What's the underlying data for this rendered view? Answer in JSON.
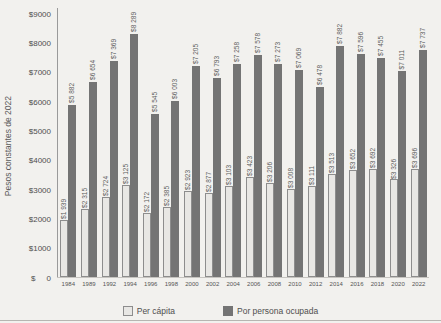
{
  "figure": {
    "legend": [
      {
        "name": "Per cápita",
        "swatch": "light"
      },
      {
        "name": "Por persona ocupada",
        "swatch": "dark"
      }
    ],
    "colors": {
      "background": "#f2f1ee",
      "light_bar": "#e8e7e4",
      "light_bar_border": "#8d8d8d",
      "dark_bar": "#747474",
      "text": "#4f4f4f",
      "axis": "#9a9a9a"
    }
  },
  "chart_data": {
    "type": "bar",
    "title": "",
    "xlabel": "",
    "ylabel": "Pesos constantes de 2022",
    "ylim": [
      0,
      9000
    ],
    "grid": false,
    "legend_position": "bottom",
    "y_ticks": [
      {
        "value": 0,
        "label": "$     0"
      },
      {
        "value": 1000,
        "label": "$1000"
      },
      {
        "value": 2000,
        "label": "$2000"
      },
      {
        "value": 3000,
        "label": "$3000"
      },
      {
        "value": 4000,
        "label": "$4000"
      },
      {
        "value": 5000,
        "label": "$5000"
      },
      {
        "value": 6000,
        "label": "$6000"
      },
      {
        "value": 7000,
        "label": "$7000"
      },
      {
        "value": 8000,
        "label": "$8000"
      },
      {
        "value": 9000,
        "label": "$9000"
      }
    ],
    "categories": [
      "1984",
      "1989",
      "1992",
      "1994",
      "1996",
      "1998",
      "2000",
      "2002",
      "2004",
      "2006",
      "2008",
      "2010",
      "2012",
      "2014",
      "2016",
      "2018",
      "2020",
      "2022"
    ],
    "series": [
      {
        "name": "Per cápita",
        "values": [
          1939,
          2315,
          2724,
          3125,
          2172,
          2385,
          2923,
          2877,
          3103,
          3423,
          3206,
          3008,
          3111,
          3513,
          3652,
          3692,
          3326,
          3696
        ],
        "labels": [
          "$1 939",
          "$2 315",
          "$2 724",
          "$3 125",
          "$2 172",
          "$2 385",
          "$2 923",
          "$2 877",
          "$3 103",
          "$3 423",
          "$3 206",
          "$3 008",
          "$3 111",
          "$3 513",
          "$3 652",
          "$3 692",
          "$3 326",
          "$3 696"
        ]
      },
      {
        "name": "Por persona ocupada",
        "values": [
          5882,
          6654,
          7369,
          8289,
          5545,
          6003,
          7205,
          6793,
          7258,
          7578,
          7273,
          7069,
          6478,
          7882,
          7596,
          7455,
          7011,
          7737
        ],
        "labels": [
          "$5 882",
          "$6 654",
          "$7 369",
          "$8 289",
          "$5 545",
          "$6 003",
          "$7 205",
          "$6 793",
          "$7 258",
          "$7 578",
          "$7 273",
          "$7 069",
          "$6 478",
          "$7 882",
          "$7 596",
          "$7 455",
          "$7 011",
          "$7 737"
        ]
      }
    ]
  }
}
